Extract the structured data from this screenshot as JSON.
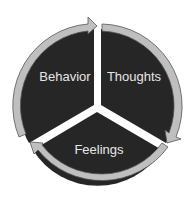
{
  "diagram": {
    "type": "cycle",
    "segments": [
      {
        "label": "Thoughts"
      },
      {
        "label": "Feelings"
      },
      {
        "label": "Behavior"
      }
    ],
    "colors": {
      "segment": "#262626",
      "ring": "#bfbfbf",
      "ring_outline": "#555555",
      "background": "#ffffff"
    }
  }
}
